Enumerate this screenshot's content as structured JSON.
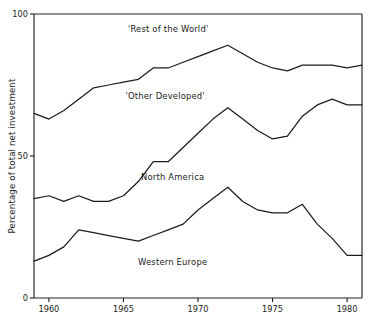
{
  "chart_data": {
    "type": "line",
    "title": "",
    "xlabel": "",
    "ylabel": "Percentage of total net investment",
    "xlim": [
      1959,
      1981
    ],
    "ylim": [
      0,
      100
    ],
    "grid": false,
    "legend_position": "inline-annotations",
    "x": [
      1959,
      1960,
      1961,
      1962,
      1963,
      1964,
      1965,
      1966,
      1967,
      1968,
      1969,
      1970,
      1971,
      1972,
      1973,
      1974,
      1975,
      1976,
      1977,
      1978,
      1979,
      1980,
      1981
    ],
    "xticks": [
      1960,
      1965,
      1970,
      1975,
      1980
    ],
    "xtick_labels": [
      "1960",
      "1965",
      "1970",
      "1975",
      "1980"
    ],
    "yticks": [
      0,
      50,
      100
    ],
    "ytick_labels": [
      "0",
      "50",
      "100"
    ],
    "series": [
      {
        "name": "Western Europe",
        "label": "Western Europe",
        "values": [
          13,
          15,
          18,
          24,
          23,
          22,
          21,
          20,
          22,
          24,
          26,
          31,
          35,
          39,
          34,
          31,
          30,
          30,
          33,
          26,
          21,
          15,
          15
        ]
      },
      {
        "name": "North America",
        "label": "North America",
        "values": [
          35,
          36,
          34,
          36,
          34,
          34,
          36,
          41,
          48,
          48,
          53,
          58,
          63,
          67,
          63,
          59,
          56,
          57,
          64,
          68,
          70,
          68,
          68
        ]
      },
      {
        "name": "Other Developed",
        "label": "'Other Developed'",
        "values": [
          65,
          63,
          66,
          70,
          74,
          75,
          76,
          77,
          81,
          81,
          83,
          85,
          87,
          89,
          86,
          83,
          81,
          80,
          82,
          82,
          82,
          81,
          82
        ]
      },
      {
        "name": "Rest of the World",
        "label": "'Rest of the World'",
        "values": [
          100,
          100,
          100,
          100,
          100,
          100,
          100,
          100,
          100,
          100,
          100,
          100,
          100,
          100,
          100,
          100,
          100,
          100,
          100,
          100,
          100,
          100,
          100
        ]
      }
    ],
    "annotations": [
      {
        "text": "'Rest of the World'",
        "x": 1968.0,
        "y": 93.5,
        "name": "rest-of-the-world"
      },
      {
        "text": "'Other Developed'",
        "x": 1967.8,
        "y": 70.0,
        "name": "other-developed"
      },
      {
        "text": "North America",
        "x": 1968.3,
        "y": 41.5,
        "name": "north-america"
      },
      {
        "text": "Western Europe",
        "x": 1968.3,
        "y": 11.5,
        "name": "western-europe"
      }
    ],
    "plot_box": {
      "left": 34,
      "right": 362,
      "top": 14,
      "bottom": 298
    }
  }
}
